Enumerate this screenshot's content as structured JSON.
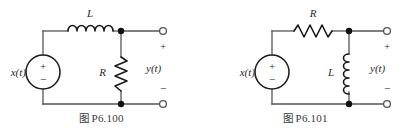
{
  "page": {
    "background": "#ffffff",
    "width": 407,
    "height": 136,
    "wire_color": "#555555",
    "component_color": "#1a1a1a",
    "text_color": "#2a2a2a"
  },
  "figures": [
    {
      "id": "P6.100",
      "caption_prefix": "图",
      "caption_number": "P6.100",
      "caption": "图 P6.100",
      "topology": "series-inductor-shunt-resistor",
      "source_label": "x(t)",
      "source_plus": "+",
      "source_minus": "−",
      "series_element_label": "L",
      "series_element_type": "inductor",
      "shunt_element_label": "R",
      "shunt_element_type": "resistor",
      "output_label": "y(t)",
      "output_plus": "+",
      "output_minus": "−"
    },
    {
      "id": "P6.101",
      "caption_prefix": "图",
      "caption_number": "P6.101",
      "caption": "图 P6.101",
      "topology": "series-resistor-shunt-inductor",
      "source_label": "x(t)",
      "source_plus": "+",
      "source_minus": "−",
      "series_element_label": "R",
      "series_element_type": "resistor",
      "shunt_element_label": "L",
      "shunt_element_type": "inductor",
      "output_label": "y(t)",
      "output_plus": "+",
      "output_minus": "−"
    }
  ]
}
